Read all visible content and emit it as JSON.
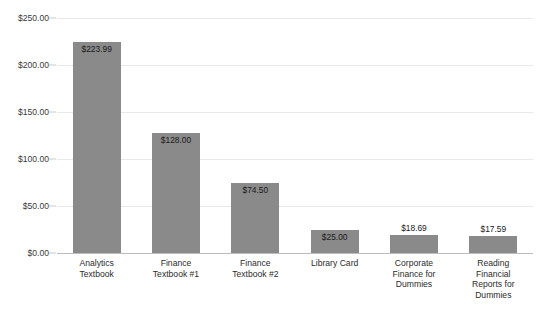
{
  "chart_data": {
    "type": "bar",
    "title": "",
    "xlabel": "",
    "ylabel": "",
    "ylim": [
      0,
      250
    ],
    "grid": true,
    "legend": "none",
    "orientation": "vertical",
    "bar_color": "#8a8a8a",
    "gridline_color": "#e9e9e9",
    "axis_color": "#bdbdbd",
    "ytick_labels": [
      "$250.00",
      "$200.00",
      "$150.00",
      "$100.00",
      "$50.00",
      "$0.00"
    ],
    "ytick_values": [
      250,
      200,
      150,
      100,
      50,
      0
    ],
    "categories": [
      "Analytics\nTextbook",
      "Finance\nTextbook #1",
      "Finance\nTextbook #2",
      "Library Card",
      "Corporate\nFinance for\nDummies",
      "Reading\nFinancial\nReports for\nDummies"
    ],
    "values": [
      223.99,
      128.0,
      74.5,
      25.0,
      18.69,
      17.59
    ],
    "data_labels": [
      "$223.99",
      "$128.00",
      "$74.50",
      "$25.00",
      "$18.69",
      "$17.59"
    ]
  }
}
